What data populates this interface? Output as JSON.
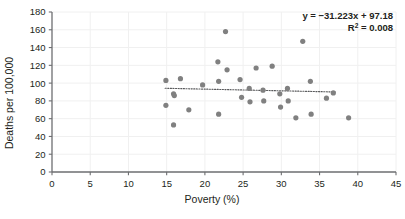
{
  "chart_data": {
    "type": "scatter",
    "title": "",
    "xlabel": "Poverty (%)",
    "ylabel": "Deaths per 100,000",
    "xlim": [
      0,
      45
    ],
    "ylim": [
      0,
      180
    ],
    "xticks": [
      0,
      5,
      10,
      15,
      20,
      25,
      30,
      35,
      40,
      45
    ],
    "yticks": [
      0,
      20,
      40,
      60,
      80,
      100,
      120,
      140,
      160,
      180
    ],
    "grid": true,
    "legend": "none",
    "marker_color": "#808080",
    "marker_size": 5.2,
    "points": [
      {
        "x": 14.9,
        "y": 103
      },
      {
        "x": 14.9,
        "y": 75
      },
      {
        "x": 15.9,
        "y": 88
      },
      {
        "x": 16.0,
        "y": 86
      },
      {
        "x": 15.9,
        "y": 53
      },
      {
        "x": 16.8,
        "y": 105
      },
      {
        "x": 17.9,
        "y": 70
      },
      {
        "x": 19.7,
        "y": 98
      },
      {
        "x": 21.7,
        "y": 124
      },
      {
        "x": 21.8,
        "y": 102
      },
      {
        "x": 21.8,
        "y": 65
      },
      {
        "x": 22.7,
        "y": 158
      },
      {
        "x": 22.9,
        "y": 115
      },
      {
        "x": 24.6,
        "y": 104
      },
      {
        "x": 24.8,
        "y": 84
      },
      {
        "x": 25.8,
        "y": 94
      },
      {
        "x": 25.9,
        "y": 79
      },
      {
        "x": 26.7,
        "y": 117
      },
      {
        "x": 27.6,
        "y": 92
      },
      {
        "x": 27.7,
        "y": 80
      },
      {
        "x": 28.8,
        "y": 119
      },
      {
        "x": 29.8,
        "y": 88
      },
      {
        "x": 29.9,
        "y": 73
      },
      {
        "x": 30.8,
        "y": 94
      },
      {
        "x": 30.9,
        "y": 80
      },
      {
        "x": 31.9,
        "y": 61
      },
      {
        "x": 32.8,
        "y": 147
      },
      {
        "x": 33.8,
        "y": 102
      },
      {
        "x": 33.9,
        "y": 65
      },
      {
        "x": 35.9,
        "y": 83
      },
      {
        "x": 36.8,
        "y": 89
      },
      {
        "x": 38.8,
        "y": 61
      }
    ],
    "trendline": {
      "style": "dotted",
      "color": "#58595b",
      "x_start": 14.8,
      "y_start": 94.2,
      "x_end": 37.2,
      "y_end": 90.0
    },
    "annotations": {
      "equation_prefix": "y = −31.223x + 97.18",
      "r_squared_label": "R",
      "r_squared_exponent": "2",
      "r_squared_value": " = 0.008"
    }
  },
  "axis": {
    "x_tick_labels": [
      "0",
      "5",
      "10",
      "15",
      "20",
      "25",
      "30",
      "35",
      "40",
      "45"
    ],
    "y_tick_labels": [
      "0",
      "20",
      "40",
      "60",
      "80",
      "100",
      "120",
      "140",
      "160",
      "180"
    ],
    "x_title": "Poverty (%)",
    "y_title": "Deaths per 100,000"
  },
  "colors": {
    "marker": "#808080",
    "axis_line": "#6d6e71",
    "gridline": "#f0f0f0",
    "text": "#231f20",
    "background": "#ffffff"
  }
}
